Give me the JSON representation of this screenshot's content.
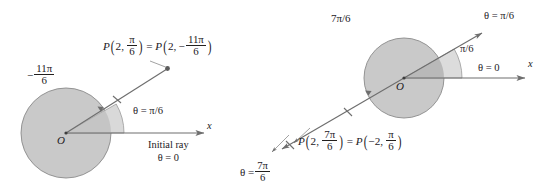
{
  "figure": {
    "colors": {
      "circle_fill": "#c9c9c9",
      "wedge_fill": "#d9d9d9",
      "overlap_fill": "#b3b3b3",
      "stroke": "#6e6e6e",
      "text": "#23201e",
      "background": "#ffffff"
    }
  },
  "left_diagram": {
    "name": "negative-angle-diagram",
    "origin_label": "O",
    "point_label": {
      "P": "P",
      "r1": "2",
      "theta1_num": "π",
      "theta1_den": "6",
      "equals": "=",
      "r2": "2",
      "sign2": "−",
      "theta2_num": "11π",
      "theta2_den": "6"
    },
    "rotation_label": {
      "sign": "−",
      "num": "11π",
      "den": "6"
    },
    "angle_label": "θ = π/6",
    "initial_ray_label": "Initial ray",
    "initial_ray_theta": "θ = 0",
    "axis_label": "x",
    "geometry": {
      "center_x": 66,
      "center_y": 133,
      "radius": 45,
      "ray_angle_deg": 30,
      "ray_length": 112
    }
  },
  "right_diagram": {
    "name": "negative-radius-diagram",
    "origin_label": "O",
    "rotation_label": "7π/6",
    "ray_label": "θ = π/6",
    "angle_label": "π/6",
    "initial_ray_theta": "θ = 0",
    "axis_label": "x",
    "point_label": {
      "P": "P",
      "r1": "2",
      "theta1_num": "7π",
      "theta1_den": "6",
      "equals": "=",
      "r2": "−2",
      "theta2_num": "π",
      "theta2_den": "6"
    },
    "opposite_ray_label": {
      "theta": "θ =",
      "num": "7π",
      "den": "6"
    },
    "geometry": {
      "center_x": 404,
      "center_y": 78,
      "radius": 40,
      "ray_angle_deg": 30
    }
  }
}
